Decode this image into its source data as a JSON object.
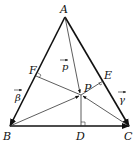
{
  "diagram": {
    "type": "triangle-vector-diagram",
    "points": {
      "A": {
        "label": "A",
        "x": 65,
        "y": 17
      },
      "B": {
        "label": "B",
        "x": 10,
        "y": 126
      },
      "C": {
        "label": "C",
        "x": 129,
        "y": 126
      },
      "D": {
        "label": "D",
        "x": 81,
        "y": 126
      },
      "E": {
        "label": "E",
        "x": 103,
        "y": 81
      },
      "F": {
        "label": "F",
        "x": 36,
        "y": 76
      },
      "P": {
        "label": "P",
        "x": 81,
        "y": 95
      }
    },
    "vectors": {
      "p": {
        "label": "p",
        "from": "A",
        "to": "P"
      },
      "beta": {
        "label": "β",
        "from": "A",
        "to": "B"
      },
      "gamma": {
        "label": "γ",
        "from": "A",
        "to": "C"
      }
    },
    "right_angle_marks": [
      "F",
      "E",
      "D"
    ],
    "colors": {
      "stroke": "#111111",
      "thin": "#333333"
    }
  }
}
